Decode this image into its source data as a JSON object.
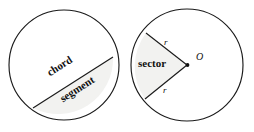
{
  "figure": {
    "background_color": "#ffffff",
    "stroke_color": "#1a1a1a",
    "shade_color": "#f2f2f0"
  },
  "left_circle": {
    "name": "chord-and-segment-circle",
    "center": {
      "x": 64,
      "y": 65
    },
    "radius": 55,
    "chord": {
      "start": {
        "x": 33,
        "y": 108
      },
      "end": {
        "x": 113,
        "y": 57
      },
      "rotation_deg": -32.5
    },
    "labels": {
      "chord": "chord",
      "segment": "segment"
    }
  },
  "right_circle": {
    "name": "sector-circle",
    "center": {
      "x": 187,
      "y": 65
    },
    "radius": 56,
    "sector": {
      "vertex": {
        "x": 187,
        "y": 65
      },
      "radius_end_top": {
        "x": 146,
        "y": 33
      },
      "radius_end_bottom": {
        "x": 145,
        "y": 99
      }
    },
    "labels": {
      "sector": "sector",
      "radius_top": "r",
      "radius_bottom": "r",
      "center_point": "O"
    }
  }
}
